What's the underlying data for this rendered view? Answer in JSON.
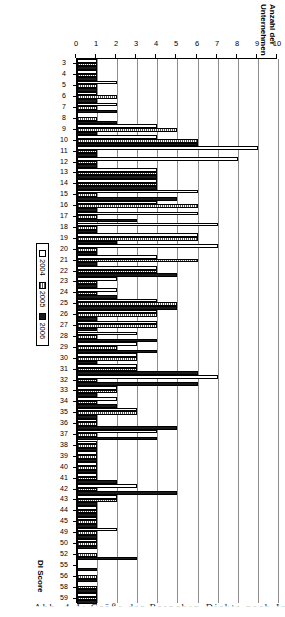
{
  "figure": {
    "caption_fragment": "Abb. 4-1: Größe der Branchen-Dickte nach Jahr",
    "legend_position": "right",
    "grid": true
  },
  "chart_data": {
    "type": "bar",
    "title": "",
    "xlabel": "DI Score",
    "ylabel": "Anzahl der Unternehmen",
    "ylim": [
      0,
      10
    ],
    "yticks": [
      0,
      1,
      2,
      3,
      4,
      5,
      6,
      7,
      8,
      9,
      10
    ],
    "orientation": "horizontal-rotated",
    "categories": [
      "3",
      "4",
      "5",
      "6",
      "7",
      "8",
      "9",
      "10",
      "11",
      "12",
      "13",
      "14",
      "15",
      "16",
      "17",
      "18",
      "19",
      "20",
      "21",
      "22",
      "23",
      "24",
      "25",
      "26",
      "27",
      "28",
      "29",
      "30",
      "31",
      "32",
      "33",
      "34",
      "35",
      "36",
      "37",
      "38",
      "39",
      "40",
      "41",
      "42",
      "43",
      "44",
      "45",
      "49",
      "50",
      "52",
      "55",
      "56",
      "58",
      "59"
    ],
    "series": [
      {
        "name": "2004",
        "color": "#ffffff",
        "values": [
          1,
          1,
          2,
          1,
          2,
          0,
          4,
          4,
          9,
          8,
          4,
          4,
          6,
          4,
          6,
          7,
          6,
          7,
          4,
          4,
          2,
          2,
          4,
          4,
          4,
          3,
          3,
          3,
          3,
          7,
          2,
          2,
          3,
          1,
          4,
          1,
          1,
          1,
          1,
          3,
          2,
          1,
          1,
          2,
          1,
          0,
          0,
          0,
          0,
          1
        ]
      },
      {
        "name": "2005",
        "color": "#585858",
        "values": [
          1,
          1,
          1,
          2,
          1,
          1,
          5,
          6,
          1,
          1,
          4,
          4,
          1,
          6,
          1,
          1,
          6,
          1,
          6,
          4,
          1,
          1,
          5,
          4,
          4,
          1,
          2,
          3,
          3,
          1,
          2,
          1,
          3,
          1,
          1,
          1,
          1,
          1,
          1,
          1,
          2,
          1,
          1,
          1,
          1,
          1,
          0,
          1,
          1,
          1
        ]
      },
      {
        "name": "2006",
        "color": "#1a1a1a",
        "values": [
          1,
          1,
          1,
          1,
          2,
          2,
          1,
          6,
          1,
          1,
          4,
          4,
          5,
          1,
          3,
          1,
          2,
          1,
          1,
          5,
          1,
          2,
          5,
          1,
          1,
          4,
          4,
          1,
          6,
          6,
          1,
          2,
          1,
          5,
          4,
          1,
          1,
          1,
          2,
          5,
          1,
          1,
          1,
          1,
          1,
          3,
          1,
          1,
          1,
          1
        ]
      }
    ],
    "legend_entries": [
      "2004",
      "2005",
      "2006"
    ]
  }
}
